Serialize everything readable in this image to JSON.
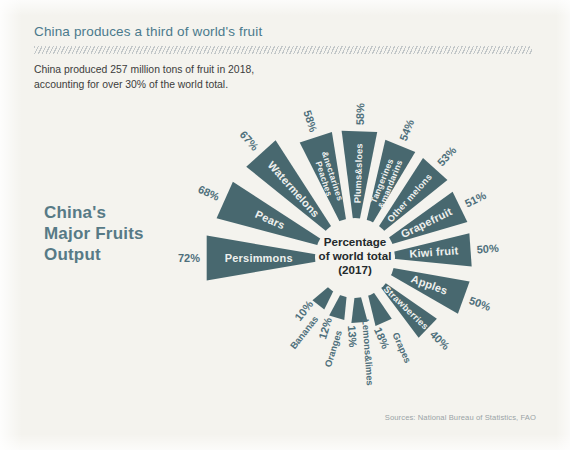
{
  "header": {
    "title": "China produces a third of world's fruit",
    "subtitle": "China produced 257 million tons of fruit in 2018,\naccounting for over 30% of the world total."
  },
  "block_title": "China's\nMajor Fruits\nOutput",
  "hub": {
    "line1": "Percentage",
    "line2": "of world total",
    "line3": "(2017)"
  },
  "source": "Sources: National Bureau of Statistics, FAO",
  "colors": {
    "background": "#f4f3ee",
    "petal": "#48686f",
    "title": "#4a7a8c",
    "accent_text": "#4e6f7b",
    "petal_label": "#eef0ee"
  },
  "chart_data": {
    "type": "bar",
    "title": "China's Major Fruits Output",
    "subtitle": "Percentage of world total (2017)",
    "xlabel": "",
    "ylabel": "Percentage of world total",
    "unit": "%",
    "ylim": [
      0,
      80
    ],
    "grid": false,
    "legend": false,
    "layout": "radial-petal",
    "categories": [
      "Persimmons",
      "Pears",
      "Watermelons",
      "Peaches & nectarines",
      "Plums & sloes",
      "Tangerines & mandarins",
      "Other melons",
      "Grapefruit",
      "Kiwi fruit",
      "Apples",
      "Strawberries",
      "Grapes",
      "Lemons & limes",
      "Oranges",
      "Bananas"
    ],
    "values": [
      72,
      68,
      67,
      58,
      58,
      54,
      53,
      51,
      50,
      50,
      40,
      18,
      13,
      12,
      10
    ],
    "value_labels": [
      "72%",
      "68%",
      "67%",
      "58%",
      "58%",
      "54%",
      "53%",
      "51%",
      "50%",
      "50%",
      "40%",
      "18%",
      "13%",
      "12%",
      "10%"
    ]
  },
  "petals": [
    {
      "name": "Persimmons",
      "value": "72%",
      "label_lines": [
        "Persimmons"
      ],
      "angle": 180,
      "len": 112,
      "half": 8.6,
      "label_size": "normal",
      "label_place": "inside",
      "value_place": "outside"
    },
    {
      "name": "Pears",
      "value": "68%",
      "label_lines": [
        "Pears"
      ],
      "angle": 204,
      "len": 106,
      "half": 8.0,
      "label_size": "normal",
      "label_place": "inside",
      "value_place": "outside"
    },
    {
      "name": "Watermelons",
      "value": "67%",
      "label_lines": [
        "Watermelons"
      ],
      "angle": 228,
      "len": 104,
      "half": 8.0,
      "label_size": "normal",
      "label_place": "inside",
      "value_place": "outside"
    },
    {
      "name": "Peaches & nectarines",
      "value": "58%",
      "label_lines": [
        "Peaches",
        "&nectarines"
      ],
      "angle": 252,
      "len": 90,
      "half": 7.6,
      "label_size": "two-line",
      "label_place": "inside",
      "value_place": "outside"
    },
    {
      "name": "Plums & sloes",
      "value": "58%",
      "label_lines": [
        "Plums&sloes"
      ],
      "angle": 272,
      "len": 90,
      "half": 8.0,
      "label_size": "small",
      "label_place": "inside",
      "value_place": "outside"
    },
    {
      "name": "Tangerines & mandarins",
      "value": "54%",
      "label_lines": [
        "Tangerines",
        "&mandarins"
      ],
      "angle": 292,
      "len": 84,
      "half": 7.6,
      "label_size": "two-line",
      "label_place": "inside",
      "value_place": "outside"
    },
    {
      "name": "Other melons",
      "value": "53%",
      "label_lines": [
        "Other melons"
      ],
      "angle": 312,
      "len": 83,
      "half": 7.8,
      "label_size": "small",
      "label_place": "inside",
      "value_place": "outside"
    },
    {
      "name": "Grapefruit",
      "value": "51%",
      "label_lines": [
        "Grapefruit"
      ],
      "angle": 334,
      "len": 80,
      "half": 8.2,
      "label_size": "normal",
      "label_place": "inside",
      "value_place": "outside"
    },
    {
      "name": "Kiwi fruit",
      "value": "50%",
      "label_lines": [
        "Kiwi fruit"
      ],
      "angle": 356,
      "len": 79,
      "half": 8.2,
      "label_size": "normal",
      "label_place": "inside",
      "value_place": "outside"
    },
    {
      "name": "Apples",
      "value": "50%",
      "label_lines": [
        "Apples"
      ],
      "angle": 20,
      "len": 79,
      "half": 8.4,
      "label_size": "normal",
      "label_place": "inside",
      "value_place": "outside"
    },
    {
      "name": "Strawberries",
      "value": "40%",
      "label_lines": [
        "Strawberries"
      ],
      "angle": 44,
      "len": 64,
      "half": 7.4,
      "label_size": "small",
      "label_place": "inside",
      "value_place": "outside"
    },
    {
      "name": "Grapes",
      "value": "18%",
      "label_lines": [
        "Grapes"
      ],
      "angle": 66,
      "len": 33,
      "half": 7.2,
      "label_size": "small",
      "label_place": "outside",
      "value_place": "outside"
    },
    {
      "name": "Lemons & limes",
      "value": "13%",
      "label_lines": [
        "Lemons&limes"
      ],
      "angle": 86,
      "len": 27,
      "half": 7.2,
      "label_size": "small",
      "label_place": "outside",
      "value_place": "outside"
    },
    {
      "name": "Oranges",
      "value": "12%",
      "label_lines": [
        "Oranges"
      ],
      "angle": 107,
      "len": 25,
      "half": 7.2,
      "label_size": "small",
      "label_place": "outside",
      "value_place": "outside"
    },
    {
      "name": "Bananas",
      "value": "10%",
      "label_lines": [
        "Bananas"
      ],
      "angle": 128,
      "len": 22,
      "half": 7.2,
      "label_size": "small",
      "label_place": "outside",
      "value_place": "outside"
    }
  ],
  "geometry": {
    "cx": 355,
    "cy": 258,
    "inner_radius": 38
  }
}
